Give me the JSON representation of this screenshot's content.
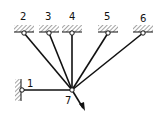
{
  "diagram": {
    "type": "truss-attachment",
    "nodes": [
      {
        "id": "1",
        "label": "1",
        "x": 22,
        "y": 90,
        "support": "wall-left"
      },
      {
        "id": "2",
        "label": "2",
        "x": 24,
        "y": 33,
        "support": "ceiling"
      },
      {
        "id": "3",
        "label": "3",
        "x": 49,
        "y": 33,
        "support": "ceiling"
      },
      {
        "id": "4",
        "label": "4",
        "x": 72,
        "y": 33,
        "support": "ceiling"
      },
      {
        "id": "5",
        "label": "5",
        "x": 108,
        "y": 33,
        "support": "ceiling"
      },
      {
        "id": "6",
        "label": "6",
        "x": 143,
        "y": 33,
        "support": "ceiling"
      },
      {
        "id": "7",
        "label": "7",
        "x": 72,
        "y": 90,
        "support": "free-joint"
      }
    ],
    "members": [
      {
        "from": "1",
        "to": "7"
      },
      {
        "from": "2",
        "to": "7"
      },
      {
        "from": "3",
        "to": "7"
      },
      {
        "from": "4",
        "to": "7"
      },
      {
        "from": "5",
        "to": "7"
      },
      {
        "from": "6",
        "to": "7"
      }
    ],
    "load": {
      "at": "7",
      "direction": "down-right",
      "icon": "force-arrow-icon"
    },
    "colors": {
      "line": "#111111",
      "hatch": "#555555",
      "background": "#ffffff"
    }
  }
}
